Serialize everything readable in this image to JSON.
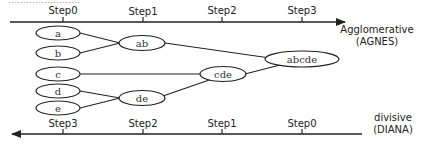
{
  "header_cutoff_text": "……………………",
  "top_axis": {
    "direction": "right",
    "steps": [
      {
        "label": "Step0",
        "x": 63
      },
      {
        "label": "Step1",
        "x": 143
      },
      {
        "label": "Step2",
        "x": 222
      },
      {
        "label": "Step3",
        "x": 302
      }
    ],
    "title_line1": "Agglomerative",
    "title_line2": "(AGNES)"
  },
  "bottom_axis": {
    "direction": "left",
    "steps": [
      {
        "label": "Step3",
        "x": 63
      },
      {
        "label": "Step2",
        "x": 143
      },
      {
        "label": "Step1",
        "x": 222
      },
      {
        "label": "Step0",
        "x": 302
      }
    ],
    "title_line1": "divisive",
    "title_line2": "(DIANA)"
  },
  "nodes": {
    "a": "a",
    "b": "b",
    "c": "c",
    "d": "d",
    "e": "e",
    "ab": "ab",
    "de": "de",
    "cde": "cde",
    "abcde": "abcde"
  },
  "colors": {
    "line": "#222222",
    "text": "#222222"
  }
}
